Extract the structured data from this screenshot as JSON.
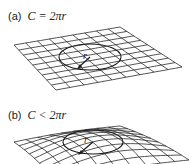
{
  "panels": [
    {
      "tag": "(a)",
      "equation": "C = 2πr",
      "surface": "flat",
      "radius_label": "r"
    },
    {
      "tag": "(b)",
      "equation": "C < 2πr",
      "surface": "positively-curved",
      "radius_label": "r"
    }
  ],
  "colors": {
    "grid": "#2a2a2a",
    "circle": "#1a1a1a",
    "text": "#222222"
  },
  "grid_divisions": 9
}
